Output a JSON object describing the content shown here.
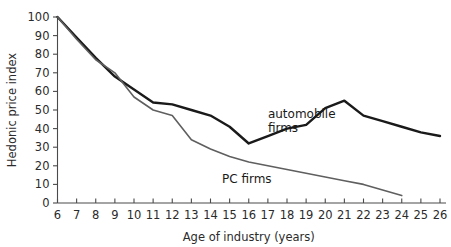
{
  "chart_data": {
    "type": "line",
    "title": "",
    "xlabel": "Age of industry (years)",
    "ylabel": "Hedonic price index",
    "xlim": [
      6,
      26
    ],
    "ylim": [
      0,
      100
    ],
    "grid": false,
    "legend_position": "inline-annotation",
    "xticks": [
      6,
      7,
      8,
      9,
      10,
      11,
      12,
      13,
      14,
      15,
      16,
      17,
      18,
      19,
      20,
      21,
      22,
      23,
      24,
      25,
      26
    ],
    "yticks": [
      0,
      10,
      20,
      30,
      40,
      50,
      60,
      70,
      80,
      90,
      100
    ],
    "series": [
      {
        "name": "automobile firms",
        "color": "#1a1a1a",
        "width": 2.4,
        "x": [
          6,
          7,
          8,
          9,
          10,
          11,
          12,
          13,
          14,
          15,
          16,
          17,
          18,
          19,
          20,
          21,
          22,
          23,
          24,
          25,
          26
        ],
        "values": [
          100,
          89,
          78,
          68,
          61,
          54,
          53,
          50,
          47,
          41,
          32,
          36,
          40,
          42,
          51,
          55,
          47,
          44,
          41,
          38,
          36
        ]
      },
      {
        "name": "PC firms",
        "color": "#5f5f5f",
        "width": 1.6,
        "x": [
          6,
          7,
          8,
          9,
          10,
          11,
          12,
          13,
          14,
          15,
          16,
          17,
          18,
          19,
          20,
          21,
          22,
          23,
          24
        ],
        "values": [
          100,
          88,
          77,
          70,
          57,
          50,
          47,
          34,
          29,
          25,
          22,
          20,
          18,
          16,
          14,
          12,
          10,
          7,
          4
        ]
      }
    ],
    "annotations": [
      {
        "text": "automobile",
        "x": 17.0,
        "y": 45.5,
        "name": "automobile-label-line1"
      },
      {
        "text": "firms",
        "x": 17.0,
        "y": 38.0,
        "name": "automobile-label-line2"
      },
      {
        "text": "PC firms",
        "x": 14.6,
        "y": 10.5,
        "name": "pc-firms-label"
      }
    ]
  },
  "axis": {
    "x_title": "Age of industry (years)",
    "y_title": "Hedonic price index"
  }
}
